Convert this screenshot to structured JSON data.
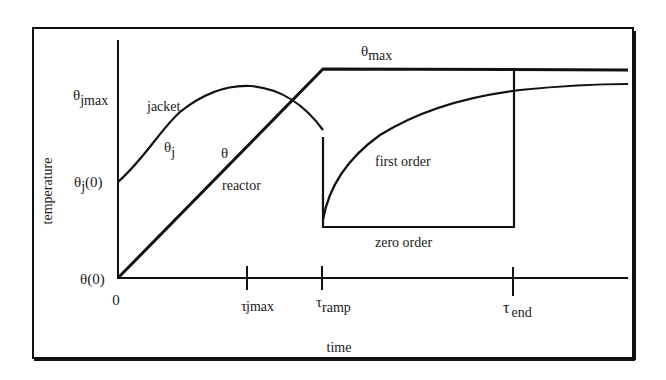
{
  "diagram": {
    "type": "temperature-time profile",
    "axes": {
      "x_label": "time",
      "y_label": "temperature",
      "origin_label": "0"
    },
    "y_ticks": {
      "theta0": {
        "sym": "θ",
        "arg": "(0)"
      },
      "thetaj0": {
        "sym": "θ",
        "sub": "j",
        "arg": "(0)"
      },
      "thetajmax": {
        "sym": "θ",
        "sub": "jmax"
      }
    },
    "x_ticks": {
      "tau_jmax": {
        "sym": "τ",
        "sub": "jmax"
      },
      "tau_ramp": {
        "sym": "τ",
        "sub": "ramp"
      },
      "tau_end": {
        "sym": "τ",
        "sub": "end"
      }
    },
    "curve_labels": {
      "theta_max": {
        "sym": "θ",
        "sub": "max"
      },
      "jacket": "jacket",
      "theta_j": {
        "sym": "θ",
        "sub": "j"
      },
      "theta": "θ",
      "reactor": "reactor",
      "first_order": "first order",
      "zero_order": "zero order"
    },
    "colors": {
      "line": "#111111",
      "background": "#ffffff"
    }
  }
}
